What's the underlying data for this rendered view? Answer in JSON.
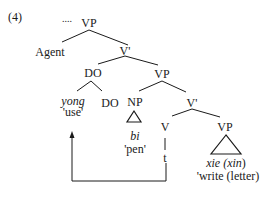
{
  "example_number": "(4)",
  "ellipsis": "....",
  "nodes": {
    "vp_root": "VP",
    "agent": "Agent",
    "vbar_1": "V'",
    "do_phrase": "DO",
    "vp_2": "VP",
    "yong": "yong",
    "yong_gloss": "'use'",
    "do_head": "DO",
    "np": "NP",
    "vbar_2": "V'",
    "bi": "bi",
    "bi_gloss": "'pen'",
    "v": "V",
    "vp_3": "VP",
    "trace": "t",
    "xie_prefix": "xie (",
    "xin": "xin",
    "xie_suffix": ")",
    "xie_gloss": "'write (letter)"
  },
  "colors": {
    "ink": "#1a1a1a",
    "background": "#ffffff"
  }
}
